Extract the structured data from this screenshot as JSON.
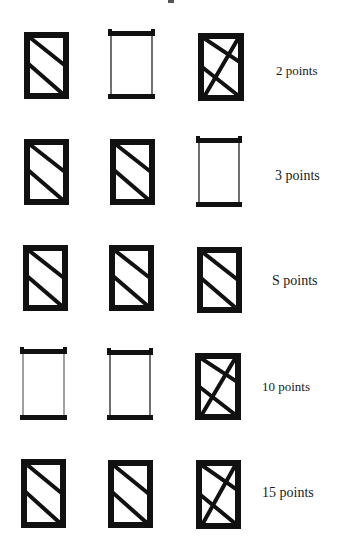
{
  "figure": {
    "ink_color": "#111111",
    "rows": [
      {
        "label": "2 points",
        "top": 28,
        "cells": [
          {
            "type": "diag-two",
            "x": 24,
            "y": 32,
            "w": 45,
            "h": 67
          },
          {
            "type": "open-bars",
            "x": 108,
            "y": 29,
            "w": 47,
            "h": 71
          },
          {
            "type": "cross",
            "x": 198,
            "y": 33,
            "w": 46,
            "h": 68
          }
        ],
        "label_x": 276,
        "label_y": 63
      },
      {
        "label": "3 points",
        "top": 139,
        "cells": [
          {
            "type": "diag-two",
            "x": 24,
            "y": 139,
            "w": 45,
            "h": 66
          },
          {
            "type": "diag-two",
            "x": 110,
            "y": 139,
            "w": 45,
            "h": 66
          },
          {
            "type": "open-bars",
            "x": 196,
            "y": 136,
            "w": 46,
            "h": 72
          }
        ],
        "label_x": 275,
        "label_y": 168
      },
      {
        "label": "S points",
        "top": 244,
        "cells": [
          {
            "type": "diag-two",
            "x": 23,
            "y": 245,
            "w": 45,
            "h": 66
          },
          {
            "type": "diag-two",
            "x": 109,
            "y": 245,
            "w": 45,
            "h": 66
          },
          {
            "type": "diag-two",
            "x": 197,
            "y": 247,
            "w": 45,
            "h": 66
          }
        ],
        "label_x": 272,
        "label_y": 273
      },
      {
        "label": "10 points",
        "top": 346,
        "cells": [
          {
            "type": "open-bars-thin",
            "x": 20,
            "y": 347,
            "w": 47,
            "h": 74
          },
          {
            "type": "open-bars",
            "x": 107,
            "y": 348,
            "w": 46,
            "h": 73
          },
          {
            "type": "cross",
            "x": 195,
            "y": 353,
            "w": 46,
            "h": 67
          }
        ],
        "label_x": 262,
        "label_y": 379
      },
      {
        "label": "15 points",
        "top": 459,
        "cells": [
          {
            "type": "diag-two",
            "x": 21,
            "y": 459,
            "w": 45,
            "h": 69
          },
          {
            "type": "diag-two",
            "x": 108,
            "y": 460,
            "w": 45,
            "h": 68
          },
          {
            "type": "cross",
            "x": 196,
            "y": 460,
            "w": 45,
            "h": 69
          }
        ],
        "label_x": 262,
        "label_y": 485
      }
    ]
  }
}
